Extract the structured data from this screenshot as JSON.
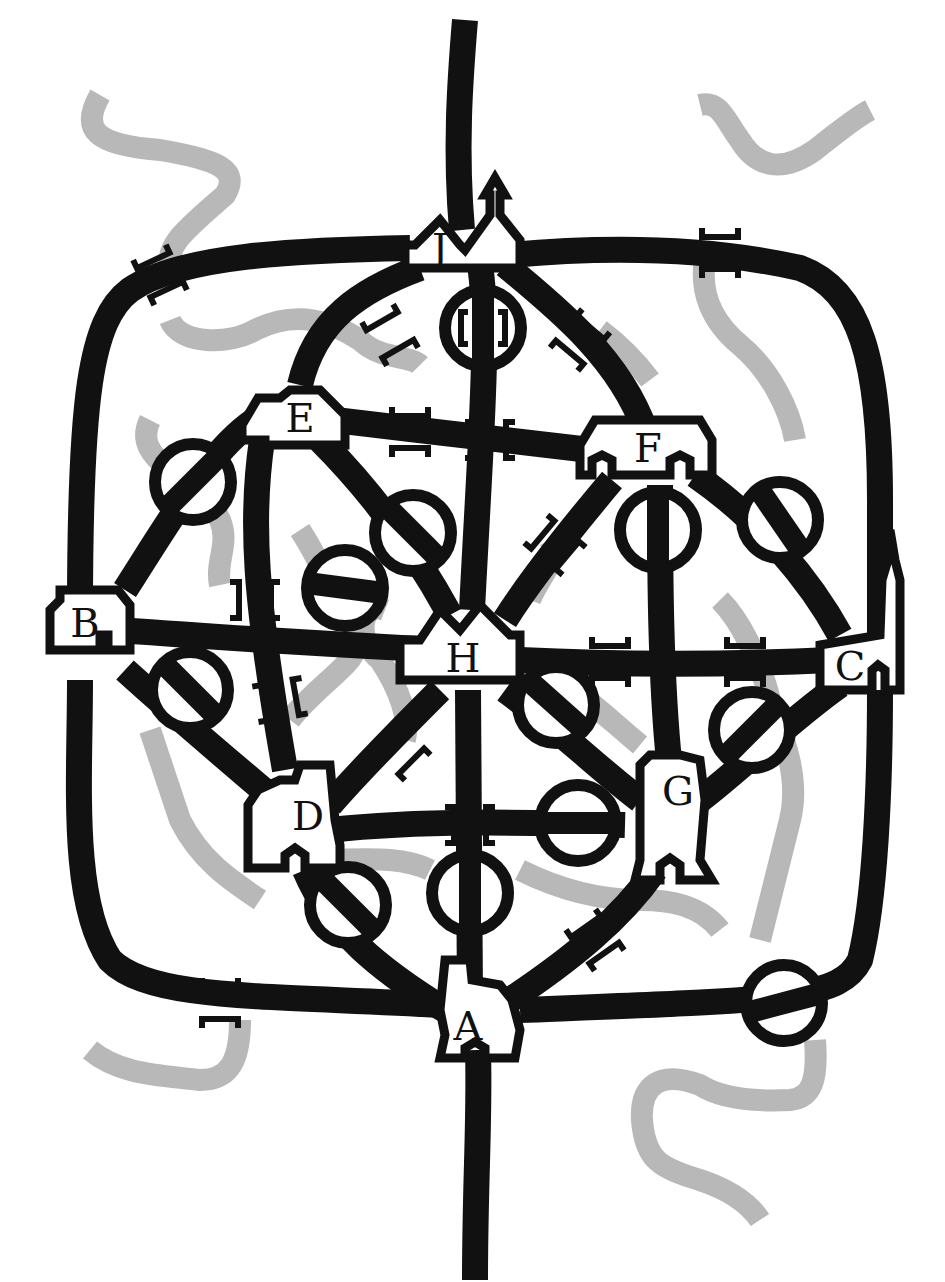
{
  "diagram": {
    "type": "road-and-river puzzle map",
    "colors": {
      "road": "#111111",
      "river": "#b8b8b8",
      "background": "#ffffff",
      "town_fill": "#ffffff"
    },
    "towns": [
      {
        "id": "J",
        "label": "J",
        "x": 440,
        "y": 245,
        "shape": "church-with-spire"
      },
      {
        "id": "E",
        "label": "E",
        "x": 295,
        "y": 410,
        "shape": "house"
      },
      {
        "id": "F",
        "label": "F",
        "x": 640,
        "y": 460,
        "shape": "long-house-arches"
      },
      {
        "id": "B",
        "label": "B",
        "x": 88,
        "y": 633,
        "shape": "house-with-chimney"
      },
      {
        "id": "H",
        "label": "H",
        "x": 463,
        "y": 643,
        "shape": "double-gable-house"
      },
      {
        "id": "C",
        "label": "C",
        "x": 852,
        "y": 655,
        "shape": "cathedral-with-spire"
      },
      {
        "id": "D",
        "label": "D",
        "x": 300,
        "y": 822,
        "shape": "castle-arch"
      },
      {
        "id": "G",
        "label": "G",
        "x": 672,
        "y": 808,
        "shape": "tower-arch"
      },
      {
        "id": "A",
        "label": "A",
        "x": 470,
        "y": 1040,
        "shape": "castle-arch"
      }
    ],
    "roads": [
      {
        "from": "J",
        "to": "north-exit"
      },
      {
        "from": "A",
        "to": "south-exit"
      },
      {
        "from": "J",
        "to": "B",
        "route": "outer-left"
      },
      {
        "from": "J",
        "to": "C",
        "route": "outer-right"
      },
      {
        "from": "B",
        "to": "A",
        "route": "outer-left"
      },
      {
        "from": "C",
        "to": "A",
        "route": "outer-right"
      },
      {
        "from": "J",
        "to": "E"
      },
      {
        "from": "J",
        "to": "H"
      },
      {
        "from": "J",
        "to": "F"
      },
      {
        "from": "E",
        "to": "F"
      },
      {
        "from": "E",
        "to": "B"
      },
      {
        "from": "E",
        "to": "D"
      },
      {
        "from": "E",
        "to": "H"
      },
      {
        "from": "F",
        "to": "H"
      },
      {
        "from": "F",
        "to": "G"
      },
      {
        "from": "F",
        "to": "C"
      },
      {
        "from": "B",
        "to": "H"
      },
      {
        "from": "B",
        "to": "D"
      },
      {
        "from": "H",
        "to": "C"
      },
      {
        "from": "H",
        "to": "D"
      },
      {
        "from": "H",
        "to": "A"
      },
      {
        "from": "H",
        "to": "G"
      },
      {
        "from": "D",
        "to": "G"
      },
      {
        "from": "D",
        "to": "A"
      },
      {
        "from": "G",
        "to": "C"
      },
      {
        "from": "G",
        "to": "A"
      }
    ],
    "legend_symbols": {
      "bridge": "pair of bracket marks beside road where river crosses",
      "circled_crossing": "ring around a bridge crossing"
    },
    "circled_crossings": [
      {
        "x": 483,
        "y": 328
      },
      {
        "x": 193,
        "y": 482
      },
      {
        "x": 413,
        "y": 533
      },
      {
        "x": 345,
        "y": 588
      },
      {
        "x": 658,
        "y": 530
      },
      {
        "x": 780,
        "y": 520
      },
      {
        "x": 190,
        "y": 690
      },
      {
        "x": 556,
        "y": 705
      },
      {
        "x": 752,
        "y": 730
      },
      {
        "x": 578,
        "y": 823
      },
      {
        "x": 348,
        "y": 905
      },
      {
        "x": 470,
        "y": 893
      },
      {
        "x": 784,
        "y": 1003
      }
    ]
  }
}
